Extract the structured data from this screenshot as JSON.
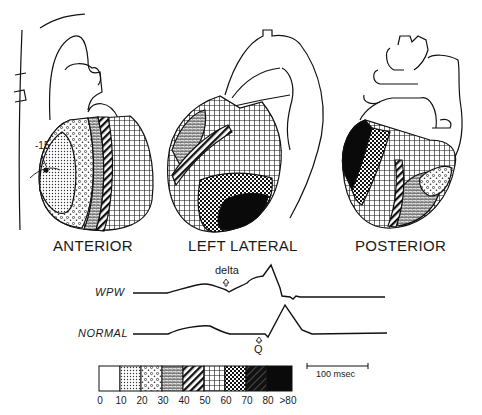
{
  "figure": {
    "views": [
      {
        "label": "ANTERIOR"
      },
      {
        "label": "LEFT LATERAL"
      },
      {
        "label": "POSTERIOR"
      }
    ],
    "anterior_annotation": "-15",
    "traces": {
      "wpw": {
        "label": "WPW",
        "marker": "delta"
      },
      "normal": {
        "label": "NORMAL",
        "marker": "Q"
      }
    },
    "scale_bar": {
      "label": "100 msec"
    },
    "legend": {
      "unit_hint": "activation time (msec)",
      "ticks": [
        "0",
        "10",
        "20",
        "30",
        "40",
        "50",
        "60",
        "70",
        "80",
        ">80"
      ],
      "bins": [
        {
          "range": "0-10",
          "pattern": "blank"
        },
        {
          "range": "10-20",
          "pattern": "fine-dots"
        },
        {
          "range": "20-30",
          "pattern": "stipple-circles"
        },
        {
          "range": "30-40",
          "pattern": "brick-fine"
        },
        {
          "range": "40-50",
          "pattern": "diagonal-stripes"
        },
        {
          "range": "50-60",
          "pattern": "squares-grid"
        },
        {
          "range": "60-70",
          "pattern": "checker"
        },
        {
          "range": "70-80",
          "pattern": "dark-hatch"
        },
        {
          "range": ">80",
          "pattern": "solid-black"
        }
      ]
    }
  }
}
